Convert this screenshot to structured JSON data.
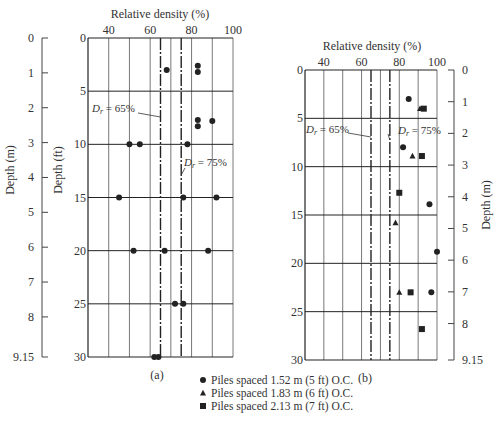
{
  "chart_data": [
    {
      "panel": "(a)",
      "type": "scatter",
      "title": "Relative density (%)",
      "xlabel": "Relative density (%)",
      "ylabel_left_m": "Depth (m)",
      "ylabel_ft": "Depth (ft)",
      "xlim": [
        30,
        100
      ],
      "ylim_ft": [
        0,
        30
      ],
      "x_ticks": [
        40,
        60,
        80,
        100
      ],
      "y_ticks_ft": [
        0,
        5,
        10,
        15,
        20,
        25,
        30
      ],
      "y_ticks_m": [
        "0",
        "1",
        "2",
        "3",
        "4",
        "5",
        "6",
        "7",
        "8",
        "9.15"
      ],
      "grid": true,
      "reference_lines": [
        {
          "label": "D_r = 65%",
          "x": 65
        },
        {
          "label": "D_r = 75%",
          "x": 75
        }
      ],
      "series": [
        {
          "name": "Piles spaced 1.52 m (5 ft) O.C.",
          "marker": "circle",
          "points": [
            [
              68,
              3
            ],
            [
              83,
              2.6
            ],
            [
              83,
              3.2
            ],
            [
              83,
              7.7
            ],
            [
              83,
              8.3
            ],
            [
              90,
              7.8
            ],
            [
              50,
              10
            ],
            [
              55,
              10
            ],
            [
              78,
              10
            ],
            [
              45,
              15
            ],
            [
              76,
              15
            ],
            [
              92,
              15
            ],
            [
              52,
              20
            ],
            [
              67,
              20
            ],
            [
              88,
              20
            ],
            [
              72,
              25
            ],
            [
              76,
              25
            ],
            [
              62,
              30
            ],
            [
              64,
              30
            ]
          ]
        }
      ]
    },
    {
      "panel": "(b)",
      "type": "scatter",
      "title": "Relative density (%)",
      "xlabel": "Relative density (%)",
      "ylabel_right_m": "Depth (m)",
      "xlim": [
        30,
        100
      ],
      "ylim_ft": [
        0,
        30
      ],
      "x_ticks": [
        40,
        60,
        80,
        100
      ],
      "y_ticks_ft": [
        0,
        5,
        10,
        15,
        20,
        25,
        30
      ],
      "y_ticks_m": [
        "0",
        "1",
        "2",
        "3",
        "4",
        "5",
        "6",
        "7",
        "8",
        "9.15"
      ],
      "grid": true,
      "reference_lines": [
        {
          "label": "D_r = 65%",
          "x": 65
        },
        {
          "label": "D_r = 75%",
          "x": 75
        }
      ],
      "series": [
        {
          "name": "Piles spaced 1.52 m (5 ft) O.C.",
          "marker": "circle",
          "points": [
            [
              85,
              3
            ],
            [
              82,
              8
            ],
            [
              96,
              13.9
            ],
            [
              100,
              18.8
            ],
            [
              97,
              23
            ]
          ]
        },
        {
          "name": "Piles spaced 1.83 m (6 ft) O.C.",
          "marker": "triangle",
          "points": [
            [
              91,
              4
            ],
            [
              87,
              8.9
            ],
            [
              78,
              15.8
            ],
            [
              80,
              23
            ]
          ]
        },
        {
          "name": "Piles spaced 2.13 m (7 ft) O.C.",
          "marker": "square",
          "points": [
            [
              93,
              4
            ],
            [
              92,
              8.9
            ],
            [
              80,
              12.7
            ],
            [
              86,
              23
            ],
            [
              92,
              26.8
            ]
          ]
        }
      ]
    }
  ],
  "labels": {
    "rel_density": "Relative density (%)",
    "depth_m": "Depth (m)",
    "depth_ft": "Depth (ft)",
    "panel_a": "(a)",
    "panel_b": "(b)",
    "dr65": "= 65%",
    "dr75": "= 75%",
    "dr_symbol": "D",
    "dr_sub": "r"
  },
  "legend": [
    {
      "marker": "circle",
      "label": "Piles spaced 1.52 m (5 ft) O.C."
    },
    {
      "marker": "triangle",
      "label": "Piles spaced 1.83 m (6 ft) O.C."
    },
    {
      "marker": "square",
      "label": "Piles spaced 2.13 m (7 ft) O.C."
    }
  ]
}
